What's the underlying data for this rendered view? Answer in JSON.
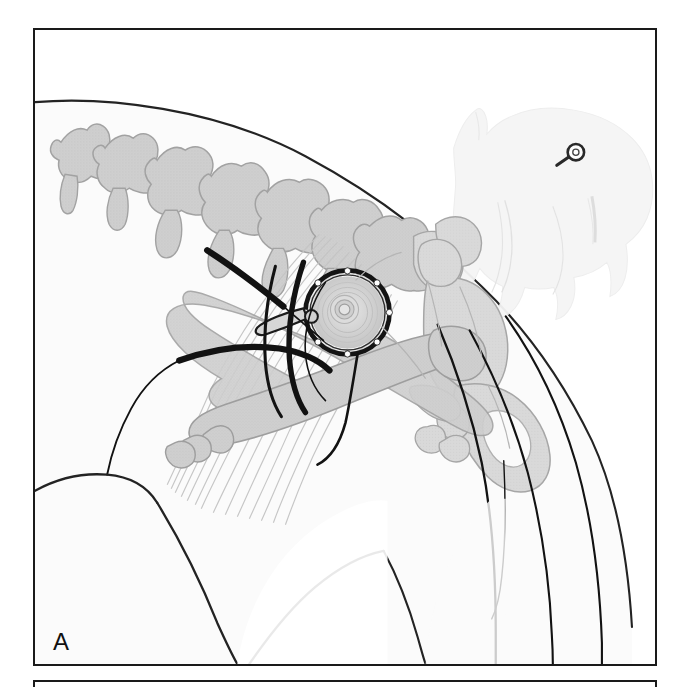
{
  "figure": {
    "kind": "medical-illustration",
    "background_color": "#ffffff",
    "frame_color": "#1a1a1a"
  },
  "panels": [
    {
      "id": "A",
      "letter": "A",
      "caption": "",
      "x": 33,
      "y": 28,
      "width": 624,
      "height": 638
    },
    {
      "id": "B",
      "letter": "",
      "caption": "",
      "x": 33,
      "y": 680,
      "width": 624,
      "height": 40
    }
  ],
  "palette": {
    "ink": "#1a1a1a",
    "outline": "#262626",
    "body_fill": "#fbfbfb",
    "body_shade": "#f2f2f2",
    "bone_fill": "#cfcfcf",
    "bone_fill_light": "#d9d9d9",
    "bone_outline": "#9a9a9a",
    "muscle_fiber": "#bcbcbc",
    "device_ring": "#151515",
    "device_face": "#d2d2d2",
    "inset_ghost": "#f4f4f4",
    "inset_line": "#dcdcdc"
  },
  "structures": {
    "spine_label": "lumbar vertebrae",
    "pelvis_label": "pelvis / ilium / ischium",
    "femur_label": "femur",
    "device_label": "circular retractor ring / acetabular implant",
    "muscle_label": "epaxial muscle fiber striations",
    "incision_label": "incision and retractor lines"
  },
  "inset": {
    "name": "orientation-inset",
    "description": "ghosted lateral silhouette of a standing cat indicating the site",
    "marker_label": "site marker",
    "x": 432,
    "y": 92,
    "width": 210,
    "height": 200
  },
  "annotations": {
    "panel_a_letter": "A"
  }
}
